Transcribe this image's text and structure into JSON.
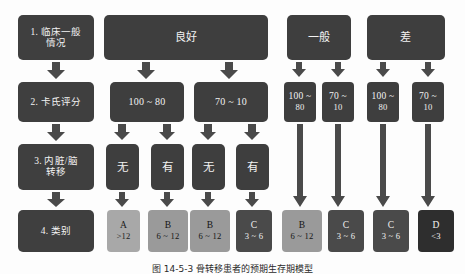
{
  "figure": {
    "caption": "图 14-5-3  骨转移患者的预期生存期模型",
    "colors": {
      "box_dark": "#3e3e3e",
      "arrow": "#4a4a4a",
      "tone_a": "#a8a8a8",
      "tone_b": "#9a9a9a",
      "tone_c": "#4a4a4a",
      "tone_d": "#2e2e2e",
      "background": "#fdfdfd"
    }
  },
  "stages": [
    {
      "id": "stage-1",
      "label": "1. 临床一般",
      "label2": "情况"
    },
    {
      "id": "stage-2",
      "label": "2. 卡氏评分",
      "label2": ""
    },
    {
      "id": "stage-3",
      "label": "3. 内脏/脑",
      "label2": "转移"
    },
    {
      "id": "stage-4",
      "label": "4. 类别",
      "label2": ""
    }
  ],
  "conditions": [
    {
      "id": "cond-good",
      "label": "良好"
    },
    {
      "id": "cond-average",
      "label": "一般"
    },
    {
      "id": "cond-poor",
      "label": "差"
    }
  ],
  "scores": {
    "good": [
      {
        "id": "score-good-high",
        "label": "100 ~ 80",
        "line1": "100 ~ 80",
        "line2": ""
      },
      {
        "id": "score-good-low",
        "label": "70 ~ 10",
        "line1": "70 ~ 10",
        "line2": ""
      }
    ],
    "average": [
      {
        "id": "score-avg-high",
        "line1": "100 ~",
        "line2": "80"
      },
      {
        "id": "score-avg-low",
        "line1": "70 ~",
        "line2": "10"
      }
    ],
    "poor": [
      {
        "id": "score-poor-high",
        "line1": "100 ~",
        "line2": "80"
      },
      {
        "id": "score-poor-low",
        "line1": "70 ~",
        "line2": "10"
      }
    ]
  },
  "metastasis": [
    {
      "id": "meta-1",
      "label": "无"
    },
    {
      "id": "meta-2",
      "label": "有"
    },
    {
      "id": "meta-3",
      "label": "无"
    },
    {
      "id": "meta-4",
      "label": "有"
    }
  ],
  "categories": [
    {
      "id": "cat-1",
      "grade": "A",
      "range": ">12",
      "tone": "tone-a"
    },
    {
      "id": "cat-2",
      "grade": "B",
      "range": "6 ~ 12",
      "tone": "tone-b"
    },
    {
      "id": "cat-3",
      "grade": "B",
      "range": "6 ~ 12",
      "tone": "tone-b"
    },
    {
      "id": "cat-4",
      "grade": "C",
      "range": "3 ~ 6",
      "tone": "tone-c"
    },
    {
      "id": "cat-5",
      "grade": "B",
      "range": "6 ~ 12",
      "tone": "tone-b"
    },
    {
      "id": "cat-6",
      "grade": "C",
      "range": "3 ~ 6",
      "tone": "tone-c"
    },
    {
      "id": "cat-7",
      "grade": "C",
      "range": "3 ~ 6",
      "tone": "tone-c"
    },
    {
      "id": "cat-8",
      "grade": "D",
      "range": "<3",
      "tone": "tone-d"
    }
  ]
}
